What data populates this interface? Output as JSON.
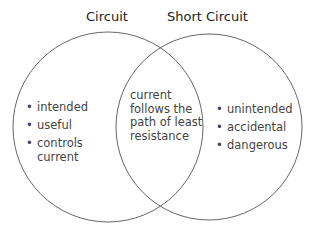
{
  "left": {
    "title": "Circuit",
    "items": [
      "intended",
      "useful",
      "controls current"
    ]
  },
  "right": {
    "title": "Short Circuit",
    "items": [
      "unintended",
      "accidental",
      "dangerous"
    ]
  },
  "overlap": {
    "text": "current follows the path of least resistance"
  },
  "colors": {
    "stroke": "#666666",
    "text": "#444444"
  }
}
